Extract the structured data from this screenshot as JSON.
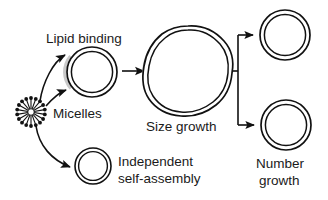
{
  "figure": {
    "background_color": "#ffffff",
    "stroke_color": "#111111",
    "shadow_color": "#c9c9c9",
    "width": 328,
    "height": 200
  },
  "labels": {
    "lipid_binding": "Lipid binding",
    "micelles": "Micelles",
    "size_growth": "Size growth",
    "independent_line1": "Independent",
    "independent_line2": "self-assembly",
    "number_line1": "Number",
    "number_line2": "growth"
  },
  "nodes": [
    {
      "id": "micelles",
      "kind": "micelle-cluster",
      "label": "Micelles",
      "cx": 31,
      "cy": 112,
      "radius": 14,
      "spokes": 18
    },
    {
      "id": "vesicle-lipid-binding",
      "kind": "vesicle",
      "label": "Lipid binding",
      "cx": 92,
      "cy": 72,
      "outer_radius": 25,
      "inner_radius": 21
    },
    {
      "id": "vesicle-independent",
      "kind": "vesicle",
      "label": "Independent self-assembly",
      "cx": 93,
      "cy": 166,
      "outer_radius": 18,
      "inner_radius": 14.5
    },
    {
      "id": "vesicle-size-growth",
      "kind": "vesicle-irregular",
      "label": "Size growth",
      "cx": 188,
      "cy": 71,
      "outer_radius": 45,
      "inner_radius": 41
    },
    {
      "id": "vesicle-number-top",
      "kind": "vesicle",
      "label": "Number growth",
      "cx": 285,
      "cy": 35,
      "outer_radius": 25,
      "inner_radius": 21
    },
    {
      "id": "vesicle-number-bottom",
      "kind": "vesicle",
      "label": "Number growth",
      "cx": 286,
      "cy": 125,
      "outer_radius": 25,
      "inner_radius": 21
    }
  ],
  "connections": [
    {
      "id": "micelle-to-lipid-upper",
      "kind": "curved-arrow",
      "from": "micelles",
      "to": "vesicle-lipid-binding"
    },
    {
      "id": "micelle-to-lipid-lower",
      "kind": "curved-arrow",
      "from": "micelles",
      "to": "vesicle-lipid-binding"
    },
    {
      "id": "micelle-to-independent",
      "kind": "curved-arrow",
      "from": "micelles",
      "to": "vesicle-independent"
    },
    {
      "id": "lipid-to-size-growth",
      "kind": "straight-arrow",
      "from": "vesicle-lipid-binding",
      "to": "vesicle-size-growth"
    },
    {
      "id": "size-growth-fork",
      "kind": "fork",
      "from": "vesicle-size-growth",
      "to": "vesicle-number-top,vesicle-number-bottom"
    }
  ]
}
